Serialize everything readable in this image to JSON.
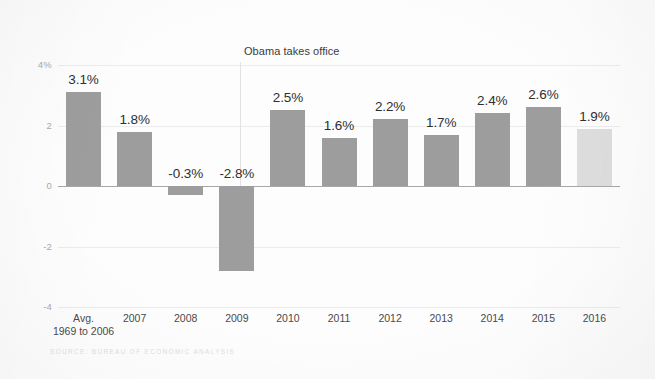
{
  "chart_data": {
    "type": "bar",
    "title": "",
    "xlabel": "",
    "ylabel": "",
    "ylim": [
      -4,
      4
    ],
    "grid": true,
    "legend": "none",
    "categories": [
      "Avg.\n1969 to 2006",
      "2007",
      "2008",
      "2009",
      "2010",
      "2011",
      "2012",
      "2013",
      "2014",
      "2015",
      "2016"
    ],
    "values": [
      3.1,
      1.8,
      -0.3,
      -2.8,
      2.5,
      1.6,
      2.2,
      1.7,
      2.4,
      2.6,
      1.9
    ],
    "data_labels": [
      "3.1%",
      "1.8%",
      "-0.3%",
      "-2.8%",
      "2.5%",
      "1.6%",
      "2.2%",
      "1.7%",
      "2.4%",
      "2.6%",
      "1.9%"
    ],
    "ytick_labels": [
      "4%",
      "2",
      "0",
      "-2",
      "-4"
    ],
    "ytick_values": [
      4,
      2,
      0,
      -2,
      -4
    ],
    "annotations": [
      {
        "text": "Obama takes office",
        "at_category_boundary": "2009|2010"
      }
    ],
    "series_colors": {
      "default_bar": "#9d9d9d",
      "highlight_bar": "#dddddd",
      "zero_line": "#a8a8a8",
      "gridline": "#ececec"
    },
    "highlighted_category": "2016",
    "source": "SOURCE: BUREAU OF ECONOMIC ANALYSIS"
  },
  "categories": [
    {
      "line1": "Avg.",
      "line2": "1969 to 2006"
    },
    {
      "line1": "2007",
      "line2": ""
    },
    {
      "line1": "2008",
      "line2": ""
    },
    {
      "line1": "2009",
      "line2": ""
    },
    {
      "line1": "2010",
      "line2": ""
    },
    {
      "line1": "2011",
      "line2": ""
    },
    {
      "line1": "2012",
      "line2": ""
    },
    {
      "line1": "2013",
      "line2": ""
    },
    {
      "line1": "2014",
      "line2": ""
    },
    {
      "line1": "2015",
      "line2": ""
    },
    {
      "line1": "2016",
      "line2": ""
    }
  ],
  "yticks": [
    {
      "label": "4%"
    },
    {
      "label": "2"
    },
    {
      "label": "0"
    },
    {
      "label": "-2"
    },
    {
      "label": "-4"
    }
  ],
  "annotation": {
    "obama_label": "Obama takes office"
  },
  "footer": {
    "source": "SOURCE: BUREAU OF ECONOMIC ANALYSIS"
  }
}
